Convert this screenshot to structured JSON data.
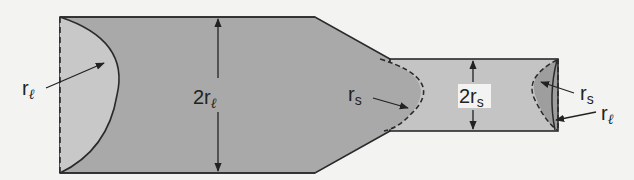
{
  "diagram": {
    "title": "",
    "colors": {
      "background": "#f3f3f1",
      "large_tube": "#a9a9a9",
      "small_tube": "#c4c4c4",
      "meniscus_large": "#c8c8c8",
      "meniscus_small_end": "#9e9e9e",
      "stroke": "#2a2a2a"
    },
    "labels": {
      "left_radius": {
        "main": "r",
        "sub": "ℓ"
      },
      "large_diameter": {
        "prefix": "2r",
        "sub": "ℓ"
      },
      "mid_radius": {
        "main": "r",
        "sub": "s"
      },
      "small_diameter": {
        "prefix": "2r",
        "sub": "s"
      },
      "right_radius_small": {
        "main": "r",
        "sub": "s"
      },
      "right_radius_large": {
        "main": "r",
        "sub": "ℓ"
      }
    }
  }
}
